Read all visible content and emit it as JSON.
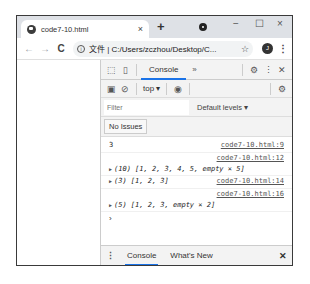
{
  "browser": {
    "tab": {
      "title": "code7-10.html",
      "close_icon": "×"
    },
    "new_tab_icon": "+",
    "window_controls": {
      "minimize": "−",
      "maximize": "☐",
      "close": "×"
    },
    "nav": {
      "back": "←",
      "forward": "→",
      "reload": "C"
    },
    "address": {
      "prefix": "文件",
      "url": "C:/Users/zczhou/Desktop/C...",
      "star": "☆"
    },
    "profile_initial": "J",
    "menu_icon": "⋮"
  },
  "devtools": {
    "toolbar": {
      "inspect_icon": "⬚",
      "device_icon": "▯",
      "active_tab": "Console",
      "more_tabs": "»",
      "settings_icon": "⚙",
      "menu_icon": "⋮",
      "close_icon": "✕"
    },
    "console_toolbar": {
      "sidebar_icon": "▣",
      "clear_icon": "⊘",
      "context": "top ▾",
      "eye_icon": "◉",
      "settings_icon": "⚙"
    },
    "filter": {
      "placeholder": "Filter",
      "levels": "Default levels ▾"
    },
    "issues_button": "No Issues",
    "messages": [
      {
        "value": "3",
        "source": "code7-10.html:9",
        "expandable": false
      },
      {
        "value": "(10) [1, 2, 3, 4, 5, empty × 5]",
        "source": "code7-10.html:12",
        "expandable": true,
        "source_above": true
      },
      {
        "value": "(3) [1, 2, 3]",
        "source": "code7-10.html:14",
        "expandable": true,
        "source_above": false
      },
      {
        "value": "(5) [1, 2, 3, empty × 2]",
        "source": "code7-10.html:16",
        "expandable": true,
        "source_above": true
      }
    ],
    "prompt": "›",
    "drawer": {
      "menu_icon": "⋮",
      "tabs": [
        "Console",
        "What's New"
      ],
      "close_icon": "✕"
    }
  }
}
